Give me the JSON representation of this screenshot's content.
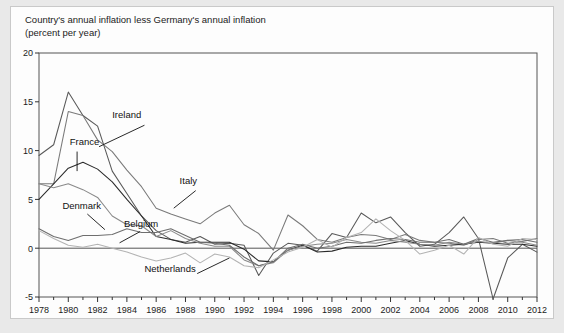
{
  "figure": {
    "title_line1": "Country's annual inflation less Germany's annual inflation",
    "title_line2": "(percent per year)",
    "background_color": "#e9e9e9",
    "panel_color": "#fdfdfd"
  },
  "chart_data": {
    "type": "line",
    "title": "Country's annual inflation less Germany's annual inflation",
    "subtitle": "(percent per year)",
    "xlabel": "",
    "ylabel": "(percent per year)",
    "xlim": [
      1978,
      2012
    ],
    "ylim": [
      -5,
      20
    ],
    "yticks": [
      -5,
      0,
      5,
      10,
      15,
      20
    ],
    "ytick_labels": [
      "-5",
      "0",
      "5",
      "10",
      "15",
      "20"
    ],
    "xticks": [
      1978,
      1980,
      1982,
      1984,
      1986,
      1988,
      1990,
      1992,
      1994,
      1996,
      1998,
      2000,
      2002,
      2004,
      2006,
      2008,
      2010,
      2012
    ],
    "xtick_labels": [
      "1978",
      "1980",
      "1982",
      "1984",
      "1986",
      "1988",
      "1990",
      "1992",
      "1994",
      "1996",
      "1998",
      "2000",
      "2002",
      "2004",
      "2006",
      "2008",
      "2010",
      "2012"
    ],
    "minor_xtick_interval": 1,
    "grid": false,
    "legend": "inline-annotations",
    "zero_reference_line": 0,
    "x": [
      1978,
      1979,
      1980,
      1981,
      1982,
      1983,
      1984,
      1985,
      1986,
      1987,
      1988,
      1989,
      1990,
      1991,
      1992,
      1993,
      1994,
      1995,
      1996,
      1997,
      1998,
      1999,
      2000,
      2001,
      2002,
      2003,
      2004,
      2005,
      2006,
      2007,
      2008,
      2009,
      2010,
      2011,
      2012
    ],
    "series": [
      {
        "name": "Ireland",
        "color": "#595959",
        "label_x": 1983.0,
        "label_y": 13.3,
        "values": [
          9.5,
          10.6,
          16.0,
          13.6,
          12.5,
          7.9,
          5.6,
          3.3,
          1.8,
          0.9,
          0.6,
          1.2,
          0.4,
          0.5,
          0.3,
          -2.8,
          -0.5,
          0.5,
          0.3,
          -0.3,
          1.5,
          1.1,
          3.6,
          2.6,
          3.2,
          1.6,
          0.2,
          0.4,
          1.6,
          3.2,
          1.0,
          -5.2,
          -1.0,
          0.4,
          -0.4
        ]
      },
      {
        "name": "Italy",
        "color": "#7a7a7a",
        "label_x": 1987.6,
        "label_y": 6.6,
        "values": [
          6.6,
          6.6,
          14.0,
          13.6,
          11.1,
          9.9,
          8.0,
          6.3,
          4.1,
          3.5,
          3.0,
          2.5,
          3.6,
          4.4,
          2.4,
          1.5,
          -0.2,
          3.4,
          2.3,
          0.9,
          0.6,
          1.1,
          1.4,
          1.3,
          0.9,
          1.4,
          0.8,
          0.6,
          0.5,
          0.3,
          0.9,
          1.0,
          0.5,
          0.7,
          1.0
        ]
      },
      {
        "name": "France",
        "color": "#2b2b2b",
        "label_x": 1980.1,
        "label_y": 10.6,
        "values": [
          5.0,
          6.6,
          8.2,
          8.8,
          8.1,
          6.8,
          5.0,
          3.3,
          1.2,
          0.9,
          0.5,
          0.6,
          0.6,
          0.6,
          -0.1,
          -1.3,
          -1.4,
          -0.2,
          0.3,
          -0.4,
          -0.3,
          0.1,
          0.2,
          0.2,
          0.5,
          0.8,
          0.4,
          0.2,
          0.3,
          0.4,
          0.6,
          0.5,
          0.4,
          0.4,
          0.2
        ]
      },
      {
        "name": "Denmark",
        "color": "#8a8a8a",
        "label_x": 1979.6,
        "label_y": 4.0,
        "values": [
          6.6,
          6.2,
          6.6,
          6.0,
          5.2,
          3.3,
          2.4,
          2.3,
          1.2,
          1.8,
          1.0,
          0.5,
          0.2,
          0.2,
          -1.2,
          -1.8,
          -1.5,
          -0.2,
          0.2,
          0.4,
          0.5,
          0.9,
          0.6,
          0.5,
          0.8,
          0.6,
          0.4,
          0.3,
          0.6,
          0.4,
          0.7,
          0.5,
          0.8,
          0.6,
          0.3
        ]
      },
      {
        "name": "Belgium",
        "color": "#6e6e6e",
        "label_x": 1983.8,
        "label_y": 2.2,
        "values": [
          2.0,
          1.2,
          0.8,
          1.3,
          1.3,
          1.4,
          2.0,
          1.6,
          1.6,
          2.0,
          1.3,
          0.6,
          0.5,
          0.3,
          -0.9,
          -1.8,
          -1.4,
          0.0,
          0.4,
          0.0,
          0.2,
          0.6,
          0.5,
          0.8,
          1.0,
          0.9,
          0.6,
          0.6,
          0.9,
          0.4,
          1.0,
          0.6,
          0.8,
          0.9,
          0.6
        ]
      },
      {
        "name": "Netherlands",
        "color": "#b3b3b3",
        "label_x": 1985.2,
        "label_y": -2.4,
        "values": [
          1.8,
          1.0,
          0.3,
          0.1,
          0.4,
          0.0,
          -0.4,
          -0.9,
          -1.3,
          -1.0,
          -0.5,
          -1.5,
          -0.6,
          -0.9,
          -1.8,
          -2.0,
          -1.2,
          -0.4,
          0.1,
          0.9,
          0.1,
          1.1,
          1.6,
          3.0,
          1.8,
          0.8,
          -0.6,
          -0.2,
          0.3,
          -0.6,
          1.1,
          0.4,
          0.2,
          1.0,
          0.9
        ]
      }
    ],
    "annotations": [
      {
        "text": "Ireland",
        "series": "Ireland"
      },
      {
        "text": "France",
        "series": "France"
      },
      {
        "text": "Italy",
        "series": "Italy"
      },
      {
        "text": "Denmark",
        "series": "Denmark"
      },
      {
        "text": "Belgium",
        "series": "Belgium"
      },
      {
        "text": "Netherlands",
        "series": "Netherlands"
      }
    ],
    "leader_lines": [
      {
        "series": "Ireland",
        "from": [
          1985.2,
          12.6
        ],
        "to": [
          1982.1,
          10.4
        ]
      },
      {
        "series": "France",
        "from": [
          1980.6,
          9.9
        ],
        "to": [
          1980.6,
          7.9
        ]
      },
      {
        "series": "Italy",
        "from": [
          1988.7,
          5.9
        ],
        "to": [
          1987.2,
          4.1
        ]
      },
      {
        "series": "Denmark",
        "from": [
          1981.3,
          3.5
        ],
        "to": [
          1982.5,
          1.9
        ]
      },
      {
        "series": "Belgium",
        "from": [
          1984.9,
          1.7
        ],
        "to": [
          1983.5,
          0.55
        ]
      },
      {
        "series": "Netherlands",
        "from": [
          1988.8,
          -2.6
        ],
        "to": [
          1991.0,
          -1.0
        ]
      }
    ]
  }
}
